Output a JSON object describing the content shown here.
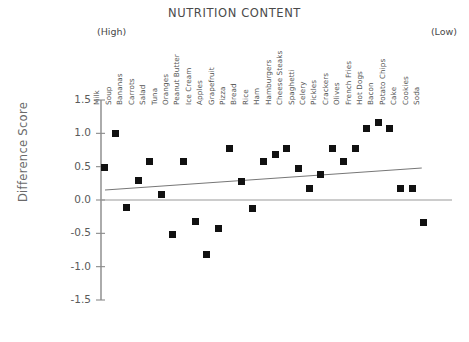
{
  "chart_data": {
    "type": "scatter",
    "title": "NUTRITION CONTENT",
    "xlabel": "",
    "ylabel": "Difference Score",
    "xlim_note": "ordinal categories ordered from high to low nutrition content",
    "ylim": [
      -1.5,
      1.5
    ],
    "ytick_labels": [
      "1.5",
      "1.0",
      "0.5",
      "0.0",
      "-0.5",
      "-1.0",
      "-1.5"
    ],
    "ytick_values": [
      1.5,
      1.0,
      0.5,
      0.0,
      -0.5,
      -1.0,
      -1.5
    ],
    "grid": false,
    "legend": "none",
    "axis_end_annotations": {
      "left": "(High)",
      "right": "(Low)"
    },
    "categories": [
      "Milk",
      "Soup",
      "Bananas",
      "Carrots",
      "Salad",
      "Tuna",
      "Oranges",
      "Peanut Butter",
      "Ice Cream",
      "Apples",
      "Grapefruit",
      "Pizza",
      "Bread",
      "Rice",
      "Ham",
      "Hamburgers",
      "Cheese Steaks",
      "Spaghetti",
      "Celery",
      "Pickles",
      "Crackers",
      "Olives",
      "French Fries",
      "Hot Dogs",
      "Bacon",
      "Potato Chips",
      "Cake",
      "Cookies",
      "Soda"
    ],
    "values": [
      0.49,
      1.0,
      -0.11,
      0.29,
      0.58,
      0.09,
      -0.51,
      0.58,
      -0.32,
      -0.81,
      -0.42,
      0.78,
      0.28,
      -0.12,
      0.58,
      0.68,
      0.78,
      0.48,
      0.18,
      0.38,
      0.78,
      0.58,
      0.78,
      1.07,
      1.17,
      1.07,
      0.18,
      0.18,
      -0.33
    ],
    "series_name": "Difference Score",
    "reference_line": {
      "y": 0.0,
      "style": "solid"
    },
    "trend_line": {
      "x_start_category": "Milk",
      "y_start": 0.15,
      "x_end_category": "Soda",
      "y_end": 0.48,
      "style": "solid"
    }
  }
}
